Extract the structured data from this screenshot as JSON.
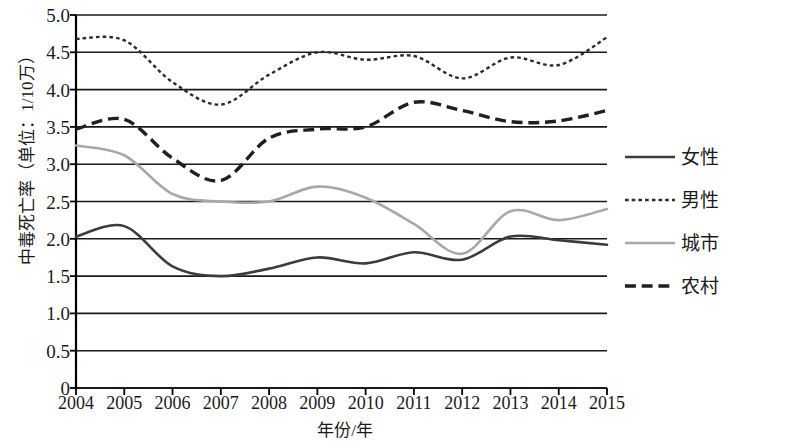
{
  "chart_data": {
    "type": "line",
    "title": "",
    "xlabel": "年份/年",
    "ylabel": "中毒死亡率（单位：1/10万）",
    "categories": [
      "2004",
      "2005",
      "2006",
      "2007",
      "2008",
      "2009",
      "2010",
      "2011",
      "2012",
      "2013",
      "2014",
      "2015"
    ],
    "ylim": [
      0,
      5.0
    ],
    "ytick_labels": [
      "5.0",
      "4.5",
      "4.0",
      "3.5",
      "3.0",
      "2.5",
      "2.0",
      "1.5",
      "1.0",
      "0.5",
      "0"
    ],
    "ytick_values": [
      5.0,
      4.5,
      4.0,
      3.5,
      3.0,
      2.5,
      2.0,
      1.5,
      1.0,
      0.5,
      0
    ],
    "grid": true,
    "grid_axis": "y",
    "legend_position": "right",
    "smoothing": "spline",
    "series": [
      {
        "name": "女性",
        "style": "solid",
        "color": "#3c3c3c",
        "width": 2.6,
        "values": [
          2.03,
          2.17,
          1.63,
          1.5,
          1.6,
          1.75,
          1.67,
          1.82,
          1.72,
          2.03,
          1.98,
          1.92
        ]
      },
      {
        "name": "男性",
        "style": "dotted",
        "color": "#2b2b2b",
        "width": 2.4,
        "values": [
          4.68,
          4.66,
          4.1,
          3.8,
          4.2,
          4.5,
          4.4,
          4.45,
          4.15,
          4.43,
          4.33,
          4.7
        ]
      },
      {
        "name": "城市",
        "style": "solid",
        "color": "#a8a8a8",
        "width": 2.6,
        "values": [
          3.25,
          3.12,
          2.6,
          2.5,
          2.5,
          2.7,
          2.55,
          2.2,
          1.8,
          2.37,
          2.25,
          2.4
        ]
      },
      {
        "name": "农村",
        "style": "dashed",
        "color": "#1f1f1f",
        "width": 3.4,
        "values": [
          3.47,
          3.6,
          3.08,
          2.78,
          3.35,
          3.47,
          3.5,
          3.83,
          3.72,
          3.57,
          3.58,
          3.72
        ]
      }
    ]
  },
  "axes": {
    "y_title": "中毒死亡率（单位：1/10万）",
    "x_title": "年份/年"
  },
  "legend": {
    "items": [
      {
        "label": "女性"
      },
      {
        "label": "男性"
      },
      {
        "label": "城市"
      },
      {
        "label": "农村"
      }
    ]
  },
  "colors": {
    "axis": "#000000",
    "grid": "#1a1a1a",
    "background": "#ffffff"
  }
}
